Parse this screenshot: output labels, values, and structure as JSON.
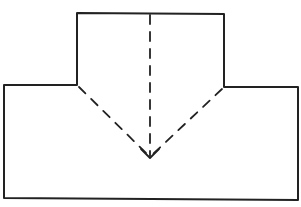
{
  "diagram": {
    "type": "folding-diagram",
    "colors": {
      "background": "#ffffff",
      "stroke": "#222222"
    },
    "shapes": {
      "t_outline": {
        "points": [
          [
            77,
            13
          ],
          [
            224,
            14
          ],
          [
            224,
            87
          ],
          [
            298,
            87
          ],
          [
            298,
            200
          ],
          [
            4,
            198
          ],
          [
            4,
            85
          ],
          [
            77,
            85
          ]
        ]
      },
      "fold_line_left": {
        "from": [
          77,
          85
        ],
        "to": [
          150,
          158
        ],
        "style": "dashed"
      },
      "fold_line_right": {
        "from": [
          224,
          87
        ],
        "to": [
          150,
          158
        ],
        "style": "dashed"
      },
      "center_line": {
        "from": [
          150,
          13
        ],
        "to": [
          150,
          158
        ],
        "style": "dashed"
      },
      "arrow": {
        "tip": [
          150,
          158
        ],
        "direction": "down"
      }
    }
  }
}
